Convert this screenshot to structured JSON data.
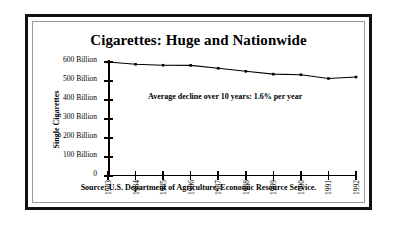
{
  "figure": {
    "title": "Cigarettes: Huge and Nationwide",
    "source_note": "Source:  U.S. Department of Agriculture, Economic Resource Service.",
    "annotation": "Average decline over 10 years: 1.6% per year",
    "frame_color": "#111111",
    "inner_frame_color": "#9a9a9a",
    "background": "#ffffff"
  },
  "chart_data": {
    "type": "line",
    "title": "Cigarettes: Huge and Nationwide",
    "subtitle": "",
    "xlabel": "",
    "ylabel": "Single Cigarettes",
    "categories": [
      "1983",
      "1984",
      "1985",
      "1986",
      "1987",
      "1988",
      "1989",
      "1990",
      "1991",
      "1992"
    ],
    "values": [
      600,
      588,
      583,
      582,
      567,
      551,
      536,
      533,
      513,
      521
    ],
    "value_unit": "Billion",
    "ylim": [
      0,
      600
    ],
    "yticks": [
      0,
      100,
      200,
      300,
      400,
      500,
      600
    ],
    "ytick_labels": [
      "0",
      "100 Billion",
      "200 Billion",
      "300 Billion",
      "400 Billion",
      "500 Billion",
      "600 Billion"
    ],
    "grid": false,
    "legend": false,
    "legend_position": "none",
    "line_color": "#000000",
    "marker": "square",
    "marker_color": "#000000",
    "annotations": [
      "Average decline over 10 years: 1.6% per year"
    ]
  }
}
